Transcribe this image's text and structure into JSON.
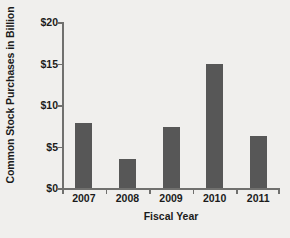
{
  "chart_data": {
    "type": "bar",
    "title": "",
    "xlabel": "Fiscal Year",
    "ylabel": "Common Stock Purchases in Billion",
    "categories": [
      "2007",
      "2008",
      "2009",
      "2010",
      "2011"
    ],
    "values": [
      7.8,
      3.5,
      7.3,
      14.9,
      6.3
    ],
    "ylim": [
      0,
      20
    ],
    "ytick_values": [
      0,
      5,
      10,
      15,
      20
    ],
    "ytick_labels": [
      "$0",
      "$5",
      "$10",
      "$15",
      "$20"
    ],
    "grid": false,
    "legend": "none",
    "series": [
      {
        "name": "Common Stock Purchases",
        "values": [
          7.8,
          3.5,
          7.3,
          14.9,
          6.3
        ]
      }
    ]
  },
  "style": {
    "bar_color": "#575757",
    "background_color": "#f0efed",
    "axis_color": "#70706e",
    "text_color": "#1b1b1b"
  }
}
